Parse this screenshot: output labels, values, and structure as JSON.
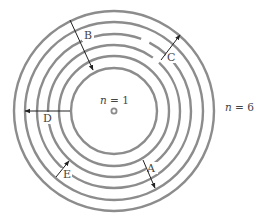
{
  "diagram": {
    "center": {
      "x": 114,
      "y": 111
    },
    "orbits": [
      {
        "n": 1,
        "r": 43
      },
      {
        "n": 2,
        "r": 55
      },
      {
        "n": 3,
        "r": 66
      },
      {
        "n": 4,
        "r": 77
      },
      {
        "n": 5,
        "r": 89
      },
      {
        "n": 6,
        "r": 100
      }
    ],
    "labels": {
      "inner": {
        "var": "n",
        "eq": " = 1"
      },
      "outer": {
        "var": "n",
        "eq": " = 6"
      }
    },
    "transitions": [
      {
        "id": "A",
        "label": "A",
        "direction": "outward"
      },
      {
        "id": "B",
        "label": "B",
        "direction": "inward"
      },
      {
        "id": "C",
        "label": "C",
        "direction": "outward"
      },
      {
        "id": "D",
        "label": "D",
        "direction": "outward"
      },
      {
        "id": "E",
        "label": "E",
        "direction": "inward"
      }
    ],
    "colors": {
      "orbit": "#8c8c8c",
      "arrow": "#222222",
      "text": "#444444"
    }
  }
}
